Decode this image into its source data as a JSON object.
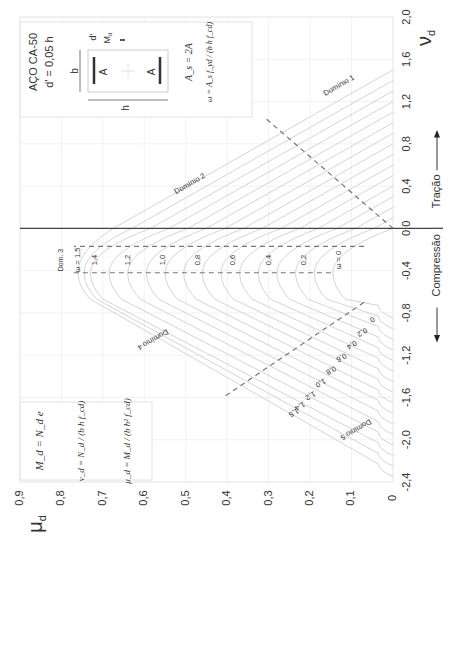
{
  "chart_data": {
    "type": "line",
    "orientation": "rotated-90 (nu_d vertical on right, mu_d horizontal at bottom)",
    "xlabel": "ν_d",
    "ylabel": "μ_d",
    "x_axis": {
      "label": "ν",
      "label_sub": "d",
      "range": [
        -2.4,
        2.0
      ],
      "ticks": [
        2.0,
        1.6,
        1.2,
        0.8,
        0.4,
        0.0,
        -0.4,
        -0.8,
        -1.2,
        -1.6,
        -2.0,
        -2.4
      ],
      "tick_labels": [
        "2,0",
        "1,6",
        "1,2",
        "0,8",
        "0,4",
        "0,0",
        "-0,4",
        "-0,8",
        "-1,2",
        "-1,6",
        "-2,0",
        "-2,4"
      ]
    },
    "y_axis": {
      "label": "μ",
      "label_sub": "d",
      "range": [
        0,
        0.9
      ],
      "ticks": [
        0.9,
        0.8,
        0.7,
        0.6,
        0.5,
        0.4,
        0.3,
        0.2,
        0.1,
        0
      ],
      "tick_labels": [
        "0,9",
        "0,8",
        "0,7",
        "0,6",
        "0,5",
        "0,4",
        "0,3",
        "0,2",
        "0,1",
        "0"
      ]
    },
    "grid": true,
    "direction_labels": {
      "compression": "Compressão",
      "tension": "Tração"
    },
    "series": [
      {
        "name": "ω = 0",
        "omega": 0.0,
        "nu_tension_end": 0.0,
        "mu_at_nu0": 0.0,
        "peak": {
          "nu": -0.42,
          "mu": 0.145
        },
        "nu_compression_end": -0.85
      },
      {
        "name": "ω = 0.1",
        "omega": 0.1,
        "nu_tension_end": 0.1,
        "mu_at_nu0": 0.045,
        "peak": {
          "nu": -0.42,
          "mu": 0.19
        },
        "nu_compression_end": -0.95
      },
      {
        "name": "ω = 0.2",
        "omega": 0.2,
        "nu_tension_end": 0.2,
        "mu_at_nu0": 0.09,
        "peak": {
          "nu": -0.42,
          "mu": 0.235
        },
        "nu_compression_end": -1.05
      },
      {
        "name": "ω = 0.3",
        "omega": 0.3,
        "nu_tension_end": 0.3,
        "mu_at_nu0": 0.135,
        "peak": {
          "nu": -0.42,
          "mu": 0.28
        },
        "nu_compression_end": -1.15
      },
      {
        "name": "ω = 0.4",
        "omega": 0.4,
        "nu_tension_end": 0.4,
        "mu_at_nu0": 0.18,
        "peak": {
          "nu": -0.42,
          "mu": 0.325
        },
        "nu_compression_end": -1.25
      },
      {
        "name": "ω = 0.5",
        "omega": 0.5,
        "nu_tension_end": 0.5,
        "mu_at_nu0": 0.225,
        "peak": {
          "nu": -0.42,
          "mu": 0.37
        },
        "nu_compression_end": -1.35
      },
      {
        "name": "ω = 0.6",
        "omega": 0.6,
        "nu_tension_end": 0.6,
        "mu_at_nu0": 0.27,
        "peak": {
          "nu": -0.42,
          "mu": 0.415
        },
        "nu_compression_end": -1.45
      },
      {
        "name": "ω = 0.7",
        "omega": 0.7,
        "nu_tension_end": 0.7,
        "mu_at_nu0": 0.315,
        "peak": {
          "nu": -0.42,
          "mu": 0.46
        },
        "nu_compression_end": -1.55
      },
      {
        "name": "ω = 0.8",
        "omega": 0.8,
        "nu_tension_end": 0.8,
        "mu_at_nu0": 0.36,
        "peak": {
          "nu": -0.42,
          "mu": 0.505
        },
        "nu_compression_end": -1.65
      },
      {
        "name": "ω = 0.9",
        "omega": 0.9,
        "nu_tension_end": 0.9,
        "mu_at_nu0": 0.405,
        "peak": {
          "nu": -0.42,
          "mu": 0.55
        },
        "nu_compression_end": -1.75
      },
      {
        "name": "ω = 1.0",
        "omega": 1.0,
        "nu_tension_end": 1.0,
        "mu_at_nu0": 0.45,
        "peak": {
          "nu": -0.42,
          "mu": 0.595
        },
        "nu_compression_end": -1.85
      },
      {
        "name": "ω = 1.1",
        "omega": 1.1,
        "nu_tension_end": 1.1,
        "mu_at_nu0": 0.495,
        "peak": {
          "nu": -0.42,
          "mu": 0.64
        },
        "nu_compression_end": -1.95
      },
      {
        "name": "ω = 1.2",
        "omega": 1.2,
        "nu_tension_end": 1.2,
        "mu_at_nu0": 0.54,
        "peak": {
          "nu": -0.42,
          "mu": 0.685
        },
        "nu_compression_end": -2.05
      },
      {
        "name": "ω = 1.3",
        "omega": 1.3,
        "nu_tension_end": 1.3,
        "mu_at_nu0": 0.585,
        "peak": {
          "nu": -0.42,
          "mu": 0.73
        },
        "nu_compression_end": -2.15
      },
      {
        "name": "ω = 1.4",
        "omega": 1.4,
        "nu_tension_end": 1.4,
        "mu_at_nu0": 0.63,
        "peak": {
          "nu": -0.42,
          "mu": 0.745
        },
        "nu_compression_end": -2.25
      },
      {
        "name": "ω = 1.5",
        "omega": 1.5,
        "nu_tension_end": 1.5,
        "mu_at_nu0": 0.675,
        "peak": {
          "nu": -0.42,
          "mu": 0.76
        },
        "nu_compression_end": -2.35
      }
    ],
    "curve_labels_mid": [
      "ω = 1,5",
      "1,4",
      "1,2",
      "1,0",
      "0,8",
      "0,6",
      "0,4",
      "0,2",
      "ω = 0"
    ],
    "curve_labels_lower": [
      "0",
      "0,2",
      "0,4",
      "0,6",
      "0,8",
      "1,0",
      "1,2",
      "1,4",
      "1,5"
    ],
    "domain_labels": [
      "Domínio 1",
      "Domínio 2",
      "Dom. 3",
      "Domínio 4",
      "Domínio 5"
    ],
    "domain_boundaries": [
      {
        "name": "1-2",
        "from": {
          "nu": 0.0,
          "mu": 0.0
        },
        "to": {
          "nu": 1.05,
          "mu": 0.31
        }
      },
      {
        "name": "2-3",
        "nu": -0.17,
        "mu_range": [
          0.07,
          0.77
        ]
      },
      {
        "name": "3-4",
        "nu": -0.42,
        "mu_range": [
          0.15,
          0.78
        ]
      },
      {
        "name": "4-5",
        "from": {
          "nu": -0.7,
          "mu": 0.07
        },
        "to": {
          "nu": -1.6,
          "mu": 0.41
        }
      }
    ],
    "annotations": {
      "steel": "AÇO  CA-50",
      "cover": "d' = 0,05 h",
      "section_dims": {
        "b": "b",
        "h": "h",
        "d_prime": "d'",
        "moment": "M",
        "moment_sub": "d",
        "bar_label": "A"
      },
      "area_eq": "A_s = 2A",
      "omega_eq": "ω = A_s f_yd / (b h f_cd)",
      "moment_eq": "M_d = N_d e",
      "nu_eq": "ν_d = N_d / (b h f_cd)",
      "mu_eq": "μ_d = M_d / (b h² f_cd)"
    }
  }
}
